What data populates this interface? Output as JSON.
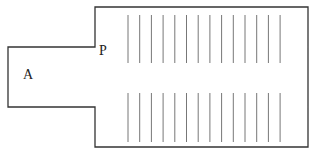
{
  "diagram": {
    "labels": {
      "room": "A",
      "door": "P"
    },
    "outline_color": "#333333",
    "line_color": "#777777",
    "upper_row_count": 14,
    "lower_row_count": 14
  }
}
